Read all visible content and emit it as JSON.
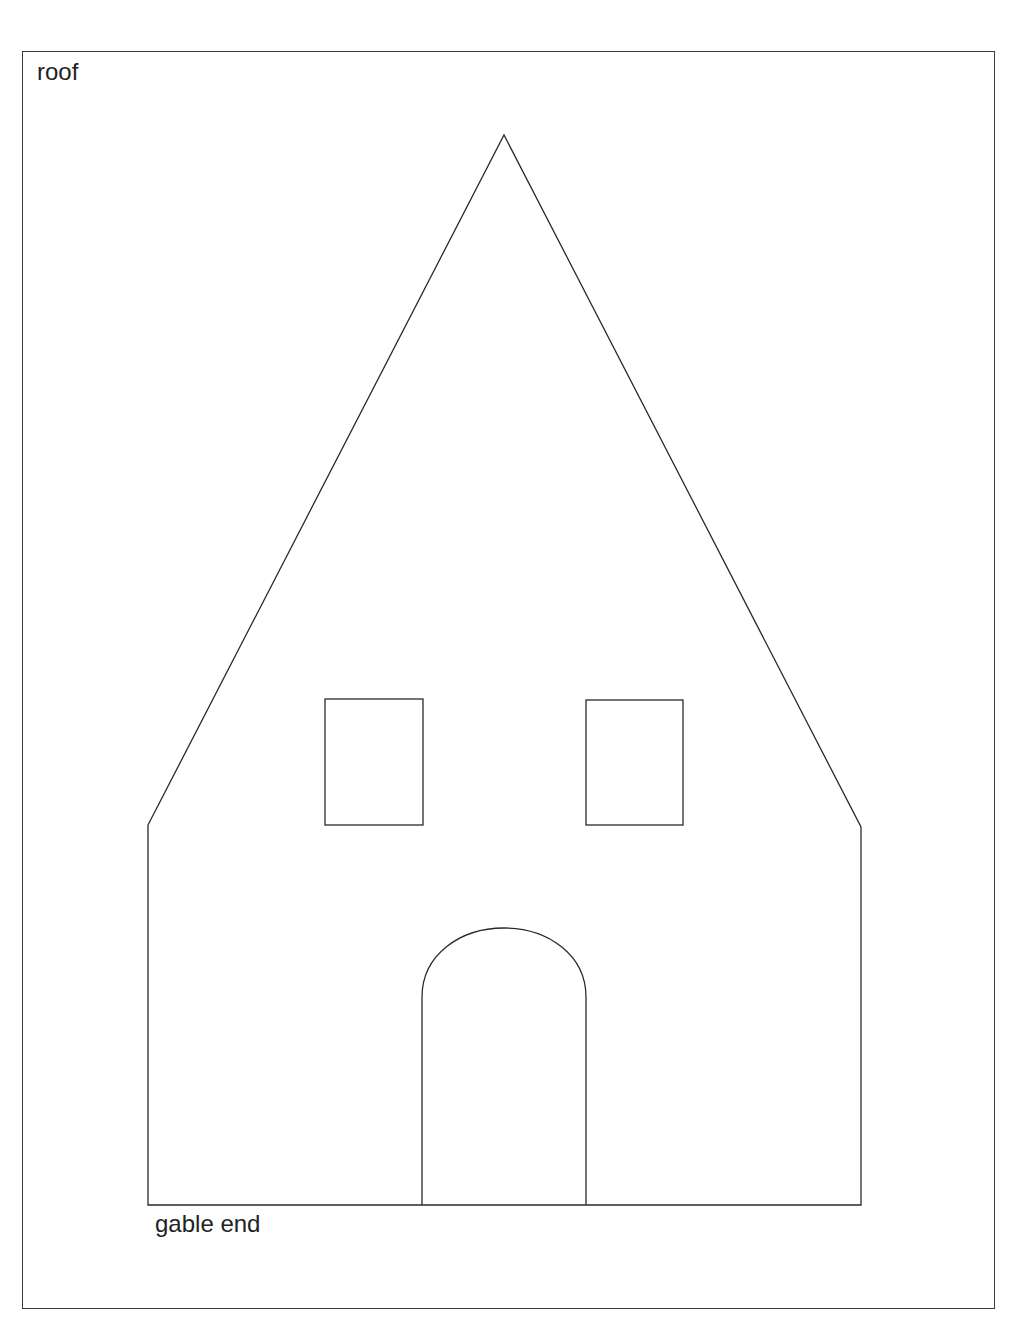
{
  "labels": {
    "top_left": "roof",
    "bottom": "gable end"
  },
  "drawing": {
    "stroke_color": "#2a2a2a",
    "background": "#ffffff",
    "shapes": [
      {
        "name": "house-outline",
        "type": "polygon",
        "points": [
          [
            148,
            825
          ],
          [
            504,
            135
          ],
          [
            861,
            827
          ],
          [
            861,
            1205
          ],
          [
            148,
            1205
          ]
        ]
      },
      {
        "name": "window-left",
        "type": "rect",
        "x": 325,
        "y": 699,
        "w": 98,
        "h": 126
      },
      {
        "name": "window-right",
        "type": "rect",
        "x": 586,
        "y": 700,
        "w": 97,
        "h": 125
      },
      {
        "name": "arched-door",
        "type": "arch",
        "x": 422,
        "y": 928,
        "w": 164,
        "h": 277
      }
    ]
  }
}
